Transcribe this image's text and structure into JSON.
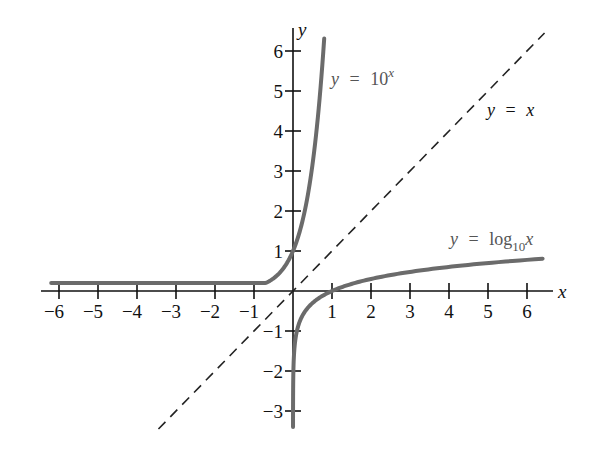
{
  "chart_data": {
    "type": "line",
    "title": "",
    "xlabel": "x",
    "ylabel": "y",
    "xlim": [
      -6.5,
      6.5
    ],
    "ylim": [
      -3.5,
      6.5
    ],
    "grid": false,
    "legend": "inline labels",
    "x_ticks": [
      -6,
      -5,
      -4,
      -3,
      -2,
      -1,
      1,
      2,
      3,
      4,
      5,
      6
    ],
    "x_tick_labels": [
      "−6",
      "−5",
      "−4",
      "−3",
      "−2",
      "−1",
      "1",
      "2",
      "3",
      "4",
      "5",
      "6"
    ],
    "y_ticks": [
      -3,
      -2,
      -1,
      1,
      2,
      3,
      4,
      5,
      6
    ],
    "y_tick_labels": [
      "−3",
      "−2",
      "−1",
      "1",
      "2",
      "3",
      "4",
      "5",
      "6"
    ],
    "series": [
      {
        "name": "y = 10^x",
        "function": "10^x",
        "style": "solid gray thick",
        "x_range": [
          -6.2,
          0.8
        ],
        "points": [
          [
            -6,
            1e-06
          ],
          [
            -4,
            0.0001
          ],
          [
            -2,
            0.01
          ],
          [
            -1,
            0.1
          ],
          [
            0,
            1
          ],
          [
            0.5,
            3.16
          ],
          [
            0.8,
            6.31
          ]
        ]
      },
      {
        "name": "y = log10 x",
        "function": "log10(x)",
        "style": "solid gray thick",
        "x_range": [
          0.0004,
          6.4
        ],
        "points": [
          [
            0.001,
            -3
          ],
          [
            0.01,
            -2
          ],
          [
            0.1,
            -1
          ],
          [
            1,
            0
          ],
          [
            2,
            0.301
          ],
          [
            3,
            0.477
          ],
          [
            4,
            0.602
          ],
          [
            5,
            0.699
          ],
          [
            6,
            0.778
          ],
          [
            6.4,
            0.806
          ]
        ]
      },
      {
        "name": "y = x",
        "function": "x",
        "style": "dashed black thin",
        "x_range": [
          -3.45,
          6.45
        ],
        "points": [
          [
            -3.45,
            -3.45
          ],
          [
            0,
            0
          ],
          [
            6.45,
            6.45
          ]
        ]
      }
    ],
    "annotations": [
      {
        "text": "y = 10^x",
        "near": [
          0.9,
          5.4
        ]
      },
      {
        "text": "y = x",
        "near": [
          5.0,
          4.6
        ]
      },
      {
        "text": "y = log10 x",
        "near": [
          4.1,
          1.2
        ]
      }
    ]
  },
  "labels": {
    "x_axis": "x",
    "y_axis": "y",
    "exp_label_lhs": "y",
    "exp_label_eq": "=",
    "exp_label_base": "10",
    "exp_label_sup": "x",
    "id_label_lhs": "y",
    "id_label_eq": "=",
    "id_label_rhs": "x",
    "log_label_lhs": "y",
    "log_label_eq": "=",
    "log_label_fn": "log",
    "log_label_sub": "10",
    "log_label_arg": "x"
  }
}
